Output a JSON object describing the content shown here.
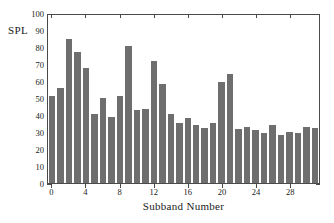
{
  "chart_data": {
    "type": "bar",
    "title": "",
    "subtitle": "",
    "xlabel": "Subband Number",
    "ylabel": "SPL",
    "xlim": [
      -0.5,
      31.5
    ],
    "ylim": [
      0,
      100
    ],
    "grid": false,
    "legend": null,
    "legend_position": "none",
    "bar_color": "#6e6e6e",
    "axis_color": "#4a4a4a",
    "background_color": "#ffffff",
    "yticks": [
      0,
      10,
      20,
      30,
      40,
      50,
      60,
      70,
      80,
      90,
      100
    ],
    "ytick_labels": [
      "0",
      "10",
      "20",
      "30",
      "40",
      "50",
      "60",
      "70",
      "80",
      "90",
      "100"
    ],
    "xticks": [
      0,
      4,
      8,
      12,
      16,
      20,
      24,
      28
    ],
    "xtick_labels": [
      "0",
      "4",
      "8",
      "12",
      "16",
      "20",
      "24",
      "28"
    ],
    "categories": [
      0,
      1,
      2,
      3,
      4,
      5,
      6,
      7,
      8,
      9,
      10,
      11,
      12,
      13,
      14,
      15,
      16,
      17,
      18,
      19,
      20,
      21,
      22,
      23,
      24,
      25,
      26,
      27,
      28,
      29,
      30,
      31
    ],
    "values": [
      52,
      56.5,
      86,
      78,
      68.5,
      41,
      50.5,
      39,
      52,
      81.5,
      43.5,
      44,
      72.5,
      59,
      41,
      36,
      38.5,
      34.5,
      33,
      36,
      60,
      65,
      32,
      33.5,
      31.5,
      30,
      34.5,
      28.5,
      30.5,
      29.5,
      33.5,
      32.5
    ]
  }
}
